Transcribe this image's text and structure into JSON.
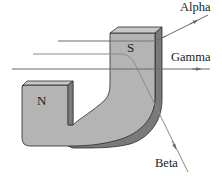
{
  "diagram": {
    "title": "",
    "magnet": {
      "north_label": "N",
      "south_label": "S",
      "face_color": "#b4b4b4",
      "top_color": "#c8c8c8",
      "side_color": "#7a7a7a",
      "outline_color": "#2a2a2a"
    },
    "rays": [
      {
        "name": "Alpha",
        "label": "Alpha",
        "deflection": "upward",
        "color": "#6a6a6a"
      },
      {
        "name": "Gamma",
        "label": "Gamma",
        "deflection": "none",
        "color": "#6a6a6a"
      },
      {
        "name": "Beta",
        "label": "Beta",
        "deflection": "downward",
        "color": "#8a8a8a"
      }
    ]
  }
}
